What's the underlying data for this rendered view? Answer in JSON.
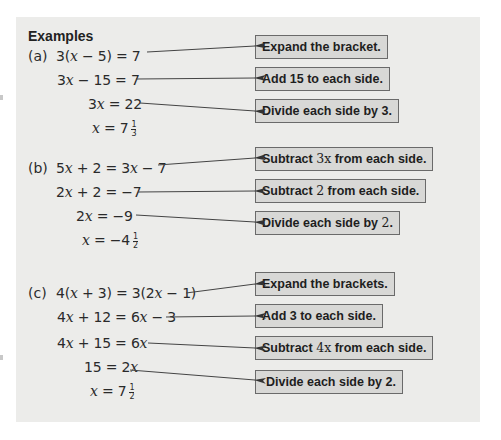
{
  "heading": "Examples",
  "examples": [
    {
      "label": "(a)",
      "steps": [
        {
          "pre": "3(",
          "var": "x",
          "post": " − 5) = 7"
        },
        {
          "pre": "3",
          "var": "x",
          "post": " − 15 = 7"
        },
        {
          "pre": "3",
          "var": "x",
          "post": " = 22"
        },
        {
          "pre": "",
          "var": "x",
          "post": " = 7",
          "frac": {
            "num": "1",
            "den": "3"
          }
        }
      ],
      "notes": [
        {
          "text": "Expand the bracket."
        },
        {
          "text": "Add 15 to each side."
        },
        {
          "text": "Divide each side by 3."
        }
      ]
    },
    {
      "label": "(b)",
      "steps": [
        {
          "pre": "5",
          "var": "x",
          "mid": " + 2 = 3",
          "var2": "x",
          "post": " − 7"
        },
        {
          "pre": "2",
          "var": "x",
          "post": " + 2 = −7"
        },
        {
          "pre": "2",
          "var": "x",
          "post": " = −9"
        },
        {
          "pre": "",
          "var": "x",
          "post": " = −4",
          "frac": {
            "num": "1",
            "den": "2"
          }
        }
      ],
      "notes": [
        {
          "before": "Subtract ",
          "math": "3x",
          "after": " from each side."
        },
        {
          "before": "Subtract ",
          "math": "2",
          "after": " from each side."
        },
        {
          "before": "Divide each side by ",
          "math": "2",
          "after": "."
        }
      ]
    },
    {
      "label": "(c)",
      "steps": [
        {
          "pre": "4(",
          "var": "x",
          "mid": " + 3) = 3(2",
          "var2": "x",
          "post": " − 1)"
        },
        {
          "pre": "4",
          "var": "x",
          "mid": " + 12 = 6",
          "var2": "x",
          "post": " − 3"
        },
        {
          "pre": "4",
          "var": "x",
          "mid": " + 15 = 6",
          "var2": "x",
          "post": ""
        },
        {
          "pre": "15 = 2",
          "var": "x",
          "post": ""
        },
        {
          "pre": "",
          "var": "x",
          "post": " = 7",
          "frac": {
            "num": "1",
            "den": "2"
          }
        }
      ],
      "notes": [
        {
          "text": "Expand the brackets."
        },
        {
          "text": "Add 3 to each side."
        },
        {
          "before": "Subtract ",
          "math": "4x",
          "after": " from each side."
        },
        {
          "text": "Divide each side by 2."
        }
      ]
    }
  ]
}
